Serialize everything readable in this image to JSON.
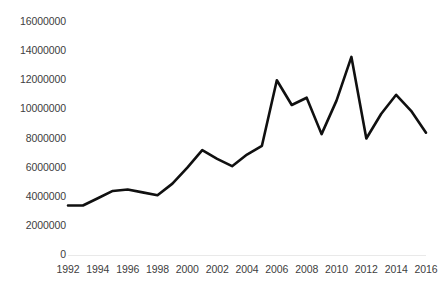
{
  "chart_data": {
    "type": "line",
    "title": "",
    "subtitle": "",
    "xlabel": "",
    "ylabel": "",
    "legend": [],
    "grid": false,
    "xlim": [
      1992,
      2016
    ],
    "ylim": [
      0,
      16000000
    ],
    "ytick_labels": [
      "16000000",
      "14000000",
      "12000000",
      "10000000",
      "8000000",
      "6000000",
      "4000000",
      "2000000",
      "0"
    ],
    "ytick_values": [
      16000000,
      14000000,
      12000000,
      10000000,
      8000000,
      6000000,
      4000000,
      2000000,
      0
    ],
    "xtick_labels": [
      "1992",
      "1994",
      "1996",
      "1998",
      "2000",
      "2002",
      "2004",
      "2006",
      "2008",
      "2010",
      "2012",
      "2014",
      "2016"
    ],
    "xtick_values": [
      1992,
      1994,
      1996,
      1998,
      2000,
      2002,
      2004,
      2006,
      2008,
      2010,
      2012,
      2014,
      2016
    ],
    "x": [
      1992,
      1993,
      1994,
      1995,
      1996,
      1997,
      1998,
      1999,
      2000,
      2001,
      2002,
      2003,
      2004,
      2005,
      2006,
      2007,
      2008,
      2009,
      2010,
      2011,
      2012,
      2013,
      2014,
      2015,
      2016
    ],
    "values": [
      3400000,
      3400000,
      3900000,
      4400000,
      4500000,
      4300000,
      4100000,
      4900000,
      6000000,
      7200000,
      6600000,
      6100000,
      6900000,
      7500000,
      12000000,
      10300000,
      10800000,
      8300000,
      10600000,
      13600000,
      8000000,
      9700000,
      11000000,
      9900000,
      8400000
    ],
    "series_name": "",
    "line_color": "#101010",
    "line_width": 2.6,
    "markers": false,
    "axis_color": "#e9e9e9",
    "text_color": "#404040",
    "background": "#ffffff"
  },
  "layout": {
    "plot_left": 68,
    "plot_right": 426,
    "plot_top": 22,
    "plot_bottom": 255
  }
}
